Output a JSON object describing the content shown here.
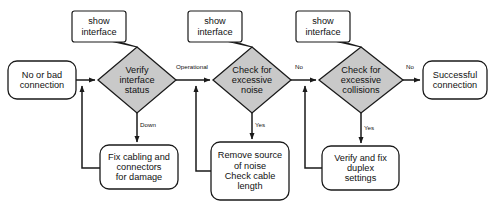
{
  "diagram": {
    "type": "flowchart",
    "colors": {
      "decision_fill": "#c9c9c9",
      "stroke": "#1a1a1a",
      "text": "#111111",
      "background": "#ffffff"
    },
    "terminators": [
      {
        "id": "start",
        "text": "No or bad\nconnection"
      },
      {
        "id": "end",
        "text": "Successful\nconnection"
      }
    ],
    "decisions": [
      {
        "id": "d1",
        "text": "Verify\ninterface\nstatus"
      },
      {
        "id": "d2",
        "text": "Check for\nexcessive\nnoise"
      },
      {
        "id": "d3",
        "text": "Check for\nexcessive\ncollisions"
      }
    ],
    "processes": [
      {
        "id": "p1",
        "text": "Fix cabling and\nconnectors\nfor damage"
      },
      {
        "id": "p2",
        "text": "Remove source\nof noise\nCheck cable\nlength"
      },
      {
        "id": "p3",
        "text": "Verify and fix\nduplex\nsettings"
      }
    ],
    "callouts": [
      {
        "id": "c1",
        "text": "show\ninterface"
      },
      {
        "id": "c2",
        "text": "show\ninterface"
      },
      {
        "id": "c3",
        "text": "show\ninterface"
      }
    ],
    "edge_labels": [
      {
        "id": "e1",
        "text": "Operational"
      },
      {
        "id": "e2",
        "text": "No"
      },
      {
        "id": "e3",
        "text": "No"
      },
      {
        "id": "e4",
        "text": "Down"
      },
      {
        "id": "e5",
        "text": "Yes"
      },
      {
        "id": "e6",
        "text": "Yes"
      }
    ]
  }
}
